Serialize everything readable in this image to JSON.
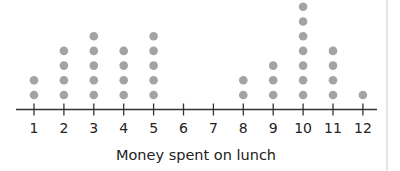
{
  "chart_data": {
    "type": "dot",
    "title": "",
    "xlabel": "Money spent on lunch",
    "ylabel": "",
    "categories": [
      "1",
      "2",
      "3",
      "4",
      "5",
      "6",
      "7",
      "8",
      "9",
      "10",
      "11",
      "12"
    ],
    "x": [
      1,
      2,
      3,
      4,
      5,
      6,
      7,
      8,
      9,
      10,
      11,
      12
    ],
    "values": [
      2,
      4,
      5,
      4,
      5,
      0,
      0,
      2,
      3,
      7,
      4,
      1
    ],
    "xlim": [
      1,
      12
    ],
    "grid": false,
    "legend": null,
    "colors": {
      "dot": "#a3a3a3",
      "axis": "#333333",
      "text": "#222222",
      "divider": "#e6e6e6"
    }
  },
  "axis": {
    "label": "Money spent on lunch",
    "ticks": [
      "1",
      "2",
      "3",
      "4",
      "5",
      "6",
      "7",
      "8",
      "9",
      "10",
      "11",
      "12"
    ]
  }
}
